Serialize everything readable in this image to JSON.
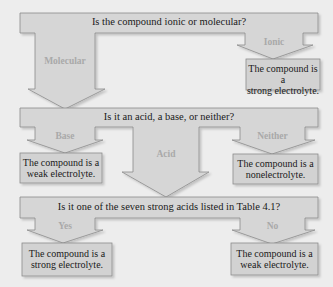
{
  "diagram": {
    "type": "flowchart",
    "colors": {
      "background": "#ededed",
      "shape_fill": "#d6d6d6",
      "box_fill": "#d2d2d2",
      "outline": "#8c8c8c",
      "question_text": "#1a1a1a",
      "branch_label": "#a9a9a9"
    },
    "questions": [
      {
        "id": "q1",
        "text": "Is the compound ionic or molecular?"
      },
      {
        "id": "q2",
        "text": "Is it an acid, a base, or neither?"
      },
      {
        "id": "q3",
        "text": "Is it one of the seven strong acids listed in Table 4.1?"
      }
    ],
    "branches": [
      {
        "id": "molecular",
        "from": "q1",
        "label": "Molecular",
        "to": "q2"
      },
      {
        "id": "ionic",
        "from": "q1",
        "label": "Ionic",
        "to": "r_ionic"
      },
      {
        "id": "base",
        "from": "q2",
        "label": "Base",
        "to": "r_base"
      },
      {
        "id": "acid",
        "from": "q2",
        "label": "Acid",
        "to": "q3"
      },
      {
        "id": "neither",
        "from": "q2",
        "label": "Neither",
        "to": "r_neither"
      },
      {
        "id": "yes",
        "from": "q3",
        "label": "Yes",
        "to": "r_yes"
      },
      {
        "id": "no",
        "from": "q3",
        "label": "No",
        "to": "r_no"
      }
    ],
    "results": [
      {
        "id": "r_ionic",
        "line1": "The compound is a",
        "line2": "strong electrolyte."
      },
      {
        "id": "r_base",
        "line1": "The compound is a",
        "line2": "weak electrolyte."
      },
      {
        "id": "r_neither",
        "line1": "The compound is a",
        "line2": "nonelectrolyte."
      },
      {
        "id": "r_yes",
        "line1": "The compound is a",
        "line2": "strong electrolyte."
      },
      {
        "id": "r_no",
        "line1": "The compound is a",
        "line2": "weak electrolyte."
      }
    ]
  }
}
